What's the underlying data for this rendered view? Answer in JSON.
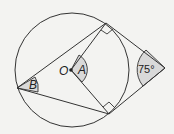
{
  "diagram": {
    "labels": {
      "center": "O",
      "angle_a": "A",
      "angle_b": "B",
      "external_angle": "75°"
    },
    "colors": {
      "line": "#333333",
      "shade": "#d9d9d9",
      "background": "#f3f3f1"
    }
  }
}
